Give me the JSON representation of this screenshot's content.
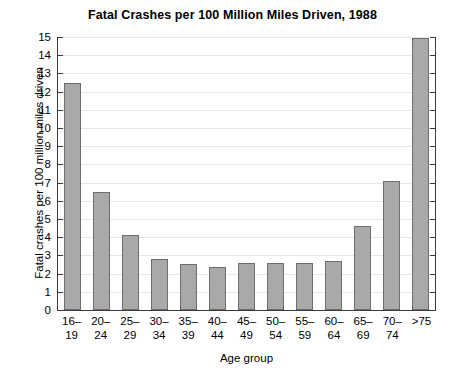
{
  "chart_data": {
    "type": "bar",
    "title": "Fatal Crashes per 100 Million Miles Driven, 1988",
    "xlabel": "Age group",
    "ylabel": "Fatal crashes per 100 million miles driven",
    "categories": [
      "16–\n19",
      "20–\n24",
      "25–\n29",
      "30–\n34",
      "35–\n39",
      "40–\n44",
      "45–\n49",
      "50–\n54",
      "55–\n59",
      "60–\n64",
      "65–\n69",
      "70–\n74",
      ">75"
    ],
    "category_lines": [
      [
        "16–",
        "19"
      ],
      [
        "20–",
        "24"
      ],
      [
        "25–",
        "29"
      ],
      [
        "30–",
        "34"
      ],
      [
        "35–",
        "39"
      ],
      [
        "40–",
        "44"
      ],
      [
        "45–",
        "49"
      ],
      [
        "50–",
        "54"
      ],
      [
        "55–",
        "59"
      ],
      [
        "60–",
        "64"
      ],
      [
        "65–",
        "69"
      ],
      [
        "70–",
        "74"
      ],
      [
        ">75",
        ""
      ]
    ],
    "values": [
      12.5,
      6.5,
      4.1,
      2.8,
      2.55,
      2.35,
      2.6,
      2.6,
      2.6,
      2.7,
      4.6,
      7.1,
      14.95
    ],
    "ylim": [
      0,
      15
    ],
    "ytick_labels": [
      "15",
      "14",
      "13",
      "12",
      "11",
      "10",
      "9",
      "8",
      "7",
      "6",
      "5",
      "4",
      "3",
      "2",
      "1",
      "0"
    ],
    "ytick_values": [
      15,
      14,
      13,
      12,
      11,
      10,
      9,
      8,
      7,
      6,
      5,
      4,
      3,
      2,
      1,
      0
    ],
    "grid": true,
    "legend": null,
    "bar_color": "#a9a9a9",
    "bar_border_color": "#6e6e6e",
    "grid_color": "#e6e6e6",
    "axis_color": "#3a3a3a"
  }
}
